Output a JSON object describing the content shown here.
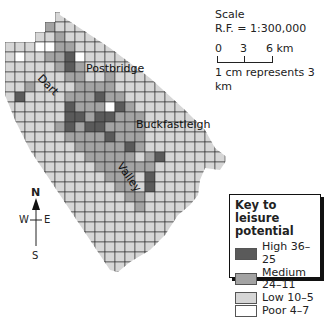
{
  "map": {
    "cell_size": 10,
    "origin_x": 5,
    "origin_y": 12,
    "cols": 22,
    "rows": 26,
    "colors": {
      "high": "#5a5a5a",
      "medium": "#a3a3a3",
      "low": "#d6d6d6",
      "poor": "#ffffff",
      "grid": "#333333"
    },
    "shade_codes": "H=high, M=medium, L=low, P=poor",
    "grid": [
      "LLLLLLLLLLLLLLLLLLLLLL",
      "LLLLMLLLLLLLLLLLLLLLLL",
      "LLLLLMLLLLLLLLLLLLLLLL",
      "LLLPPMMLLLLLLLLLLLLLLL",
      "LPLLMMHPLLLLLLLLLLLLLL",
      "LLLLLMHMLLLLLLLLLLLLLL",
      "LLLLLLMMLLMLLLLLLLLLLL",
      "LLMLLLLMMMMLLLLLLLLLLL",
      "LHLLLLMMMHMMLLLLLLLLLL",
      "LLLLLLHMMMPHMLLLLLLLLL",
      "LLLLLLHHMHHMMMLLLLLLLL",
      "LLLLLMHMHHMMMMLLLLLLLL",
      "LLLLLLMMMMHMMMLLLLLLLL",
      "LLLLLLLMMMMMHMLLLLLLLL",
      "LLLLLLLLMMMMMLMHLLLLLL",
      "LLLLLLLLLMMMMMMLLLLLLL",
      "LLLLLLLLLLMMMLHLLLLLLL",
      "LLLLLLLLLLLMMLHLLLLLLL",
      "LLLLLLLLLLLLMMLLLLLLLL",
      "LLLLLLLLLLLLLMLLLLLLLL",
      "LLLLLLLLLLLLLLLLLLLLLL",
      "LLLLLLLLLLLLLLLLLLLLLL",
      "LLLLLLLLLLLLLLLLLLLLLL",
      "LLLLLLLLLLLLLLLLLLLLLL",
      "LLLLLLLLLLLLLLLLLLLLLL",
      "LLLLLLLLLLLLLLLLLLLLLL"
    ],
    "outline": "55,12 60,12 60,15 110,48 150,78 185,110 205,130 215,148 228,158 220,170 205,168 200,180 198,195 190,205 178,215 165,235 150,250 130,262 118,272 110,270 90,240 70,210 50,180 30,150 15,120 5,95 5,42 35,42 35,32 45,32 45,22 55,22"
  },
  "places": [
    {
      "label": "Postbridge",
      "x": 86,
      "y": 62,
      "rotate": 0
    },
    {
      "label": "Dart",
      "x": 44,
      "y": 72,
      "rotate": 45
    },
    {
      "label": "Buckfastleigh",
      "x": 136,
      "y": 118,
      "rotate": 0
    },
    {
      "label": "Valley",
      "x": 125,
      "y": 160,
      "rotate": 55
    }
  ],
  "scale": {
    "title": "Scale",
    "rf": "R.F. = 1:300,000",
    "ticks": [
      "0",
      "3",
      "6 km"
    ],
    "note": "1 cm represents 3 km"
  },
  "compass": {
    "n": "N",
    "s": "S",
    "w": "W",
    "e": "E"
  },
  "key": {
    "title_line1": "Key to leisure",
    "title_line2": "potential",
    "items": [
      {
        "label": "High 36–25",
        "color": "#5a5a5a"
      },
      {
        "label": "Medium 24–11",
        "color": "#a3a3a3"
      },
      {
        "label": "Low 10–5",
        "color": "#d6d6d6"
      },
      {
        "label": "Poor 4–7",
        "color": "#ffffff"
      }
    ]
  }
}
